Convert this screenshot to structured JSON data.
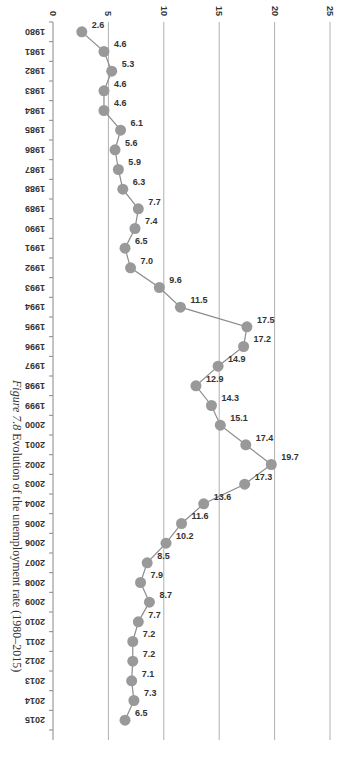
{
  "figure": {
    "caption_prefix": "Figure 7.8",
    "caption_text": "Evolution of the unemployment rate (1980–2015)",
    "orientation": "rotated-90-clockwise"
  },
  "colors": {
    "line": "#8c8c8c",
    "marker": "#999999",
    "gridline": "#b0b0b0",
    "axis": "#888888",
    "text": "#333333"
  },
  "chart_data": {
    "type": "line",
    "title": "Evolution of the unemployment rate (1980–2015)",
    "xlabel": "",
    "ylabel": "",
    "ylim": [
      0,
      25
    ],
    "yticks": [
      0,
      5,
      10,
      15,
      20,
      25
    ],
    "grid": true,
    "legend": "none",
    "categories": [
      "1980",
      "1981",
      "1982",
      "1983",
      "1984",
      "1985",
      "1986",
      "1987",
      "1988",
      "1989",
      "1990",
      "1991",
      "1992",
      "1993",
      "1994",
      "1995",
      "1996",
      "1997",
      "1998",
      "1999",
      "2000",
      "2001",
      "2002",
      "2003",
      "2004",
      "2005",
      "2006",
      "2007",
      "2008",
      "2009",
      "2010",
      "2011",
      "2012",
      "2013",
      "2014",
      "2015"
    ],
    "values": [
      2.6,
      4.6,
      5.3,
      4.6,
      4.6,
      6.1,
      5.6,
      5.9,
      6.3,
      7.7,
      7.4,
      6.5,
      7.0,
      9.6,
      11.5,
      17.5,
      17.2,
      14.9,
      12.9,
      14.3,
      15.1,
      17.4,
      19.7,
      17.3,
      13.6,
      11.6,
      10.2,
      8.5,
      7.9,
      8.7,
      7.7,
      7.2,
      7.2,
      7.1,
      7.3,
      6.5
    ],
    "data_labels": [
      "2.6",
      "4.6",
      "5.3",
      "4.6",
      "4.6",
      "6.1",
      "5.6",
      "5.9",
      "6.3",
      "7.7",
      "7.4",
      "6.5",
      "7.0",
      "9.6",
      "11.5",
      "17.5",
      "17.2",
      "14.9",
      "12.9",
      "14.3",
      "15.1",
      "17.4",
      "19.7",
      "17.3",
      "13.6",
      "11.6",
      "10.2",
      "8.5",
      "7.9",
      "8.7",
      "7.7",
      "7.2",
      "7.2",
      "7.1",
      "7.3",
      "6.5"
    ]
  }
}
